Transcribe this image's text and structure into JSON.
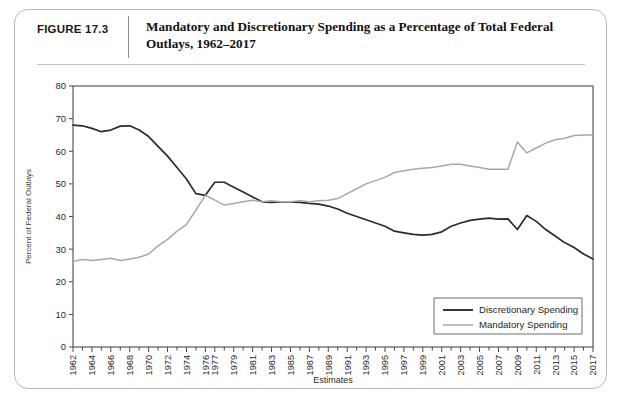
{
  "figure": {
    "number_label": "FIGURE 17.3",
    "title": "Mandatory and Discretionary Spending as a Percentage of Total Federal Outlays, 1962–2017"
  },
  "chart_data": {
    "type": "line",
    "title": "Mandatory and Discretionary Spending as a Percentage of Total Federal Outlays, 1962–2017",
    "xlabel": "Estimates",
    "ylabel": "Percent of Federal Outlays",
    "ylim": [
      0,
      80
    ],
    "ytick_values": [
      0,
      10,
      20,
      30,
      40,
      50,
      60,
      70,
      80
    ],
    "ytick_labels": [
      "0",
      "10",
      "20",
      "30",
      "40",
      "50",
      "60",
      "70",
      "80"
    ],
    "grid": false,
    "legend_position": "lower right",
    "x": [
      1962,
      1963,
      1964,
      1965,
      1966,
      1967,
      1968,
      1969,
      1970,
      1971,
      1972,
      1973,
      1974,
      1975,
      1976,
      1977,
      1978,
      1979,
      1980,
      1981,
      1982,
      1983,
      1984,
      1985,
      1986,
      1987,
      1988,
      1989,
      1990,
      1991,
      1992,
      1993,
      1994,
      1995,
      1996,
      1997,
      1998,
      1999,
      2000,
      2001,
      2002,
      2003,
      2004,
      2005,
      2006,
      2007,
      2008,
      2009,
      2010,
      2011,
      2012,
      2013,
      2014,
      2015,
      2016,
      2017
    ],
    "xtick_labels": [
      "1962",
      "1964",
      "1966",
      "1968",
      "1970",
      "1972",
      "1974",
      "1976",
      "1977",
      "1979",
      "1981",
      "1983",
      "1985",
      "1987",
      "1989",
      "1991",
      "1993",
      "1995",
      "1997",
      "1999",
      "2001",
      "2003",
      "2005",
      "2007",
      "2009",
      "2011",
      "2013",
      "2015",
      "2017"
    ],
    "xtick_label_years": [
      1962,
      1964,
      1966,
      1968,
      1970,
      1972,
      1974,
      1976,
      1977,
      1979,
      1981,
      1983,
      1985,
      1987,
      1989,
      1991,
      1993,
      1995,
      1997,
      1999,
      2001,
      2003,
      2005,
      2007,
      2009,
      2011,
      2013,
      2015,
      2017
    ],
    "series": [
      {
        "name": "Discretionary Spending",
        "color": "#2b2b2b",
        "values": [
          68,
          67.8,
          67,
          66,
          66.5,
          67.7,
          67.8,
          66.5,
          64.5,
          61.5,
          58.5,
          55,
          51.5,
          47,
          46.5,
          50.5,
          50.5,
          49,
          47.5,
          46,
          44.5,
          44.3,
          44.5,
          44.5,
          44.3,
          44,
          43.8,
          43.2,
          42.3,
          41,
          40,
          39,
          38,
          37,
          35.5,
          35,
          34.5,
          34.3,
          34.5,
          35.3,
          37,
          38,
          38.8,
          39.2,
          39.5,
          39.2,
          39.3,
          36,
          40.3,
          38.5,
          36,
          34,
          32,
          30.5,
          28.5,
          27
        ]
      },
      {
        "name": "Mandatory Spending",
        "color": "#a8a8a8",
        "values": [
          26.2,
          26.8,
          26.5,
          26.8,
          27.2,
          26.5,
          27,
          27.5,
          28.5,
          31,
          33,
          35.5,
          37.5,
          42,
          46.5,
          45,
          43.5,
          44,
          44.5,
          45,
          44.5,
          44.8,
          44.5,
          44.5,
          44.8,
          44.5,
          44.8,
          45,
          45.5,
          47,
          48.5,
          50,
          51,
          52,
          53.5,
          54,
          54.5,
          54.8,
          55,
          55.5,
          56,
          56,
          55.5,
          55,
          54.5,
          54.5,
          54.5,
          62.8,
          59.5,
          61,
          62.5,
          63.5,
          64,
          64.8,
          65,
          65
        ]
      }
    ]
  },
  "legend": {
    "items": [
      {
        "label": "Discretionary Spending",
        "color": "#2b2b2b"
      },
      {
        "label": "Mandatory Spending",
        "color": "#a8a8a8"
      }
    ]
  }
}
